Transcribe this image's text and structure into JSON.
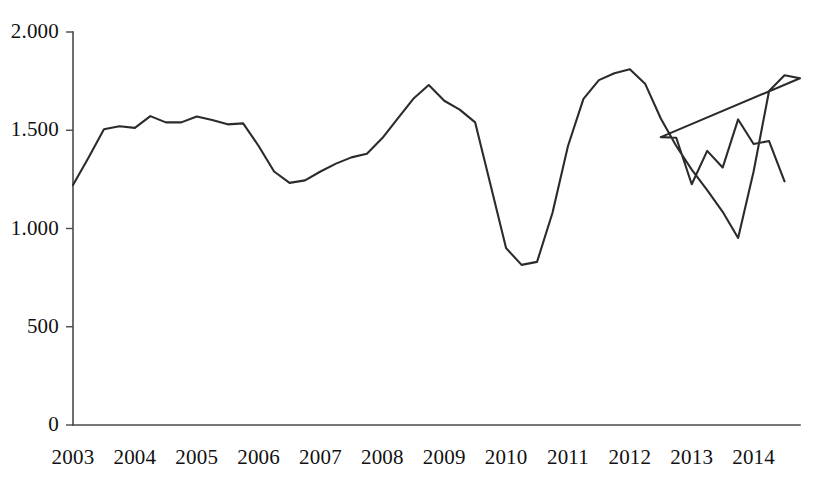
{
  "chart_data": {
    "type": "line",
    "title": "",
    "subtitle": "",
    "xlabel": "",
    "ylabel": "",
    "grid": false,
    "legend": null,
    "legend_position": "none",
    "line_color": "#2b2b2b",
    "axis_color": "#4a4a4a",
    "background": "#ffffff",
    "ylim": [
      0,
      2000
    ],
    "ytick_labels": [
      "2.000",
      "1.500",
      "1.000",
      "500",
      "0"
    ],
    "ytick_values": [
      2000,
      1500,
      1000,
      500,
      0
    ],
    "xtick_labels": [
      "2003",
      "2004",
      "2005",
      "2006",
      "2007",
      "2008",
      "2009",
      "2010",
      "2011",
      "2012",
      "2013",
      "2014"
    ],
    "xtick_values": [
      2003,
      2004,
      2005,
      2006,
      2007,
      2008,
      2009,
      2010,
      2011,
      2012,
      2013,
      2014
    ],
    "xlim": [
      2003,
      2014.75
    ],
    "series": [
      {
        "name": "series-1",
        "x": [
          2003.0,
          2003.25,
          2003.5,
          2003.75,
          2004.0,
          2004.25,
          2004.5,
          2004.75,
          2005.0,
          2005.25,
          2005.5,
          2005.75,
          2006.0,
          2006.25,
          2006.5,
          2006.75,
          2007.0,
          2007.25,
          2007.5,
          2007.75,
          2008.0,
          2008.25,
          2008.5,
          2008.75,
          2009.0,
          2009.25,
          2009.5,
          2009.75,
          2010.0,
          2010.25,
          2010.5,
          2010.75,
          2011.0,
          2011.25,
          2011.5,
          2011.75,
          2012.0,
          2012.25,
          2012.5,
          2012.75,
          2013.0,
          2013.25,
          2013.5,
          2013.75,
          2014.0,
          2014.25,
          2014.5,
          2014.75
        ],
        "values": [
          1221,
          1360,
          1505,
          1520,
          1512,
          1572,
          1540,
          1540,
          1570,
          1552,
          1530,
          1535,
          1420,
          1290,
          1232,
          1245,
          1290,
          1330,
          1362,
          1380,
          1460,
          1560,
          1660,
          1730,
          1650,
          1605,
          1540,
          1220,
          900,
          815,
          830,
          1080,
          1420,
          1660,
          1755,
          1790,
          1810,
          1735,
          1560,
          1420,
          1300,
          1195,
          1085,
          952,
          1290,
          1700,
          1780,
          1765
        ]
      }
    ],
    "tail_x": [
      2012.5,
      2012.75,
      2013.0,
      2013.25,
      2013.5,
      2013.75,
      2014.0,
      2014.25,
      2014.5,
      2014.75
    ],
    "tail_values": [
      1465,
      1462,
      1225,
      1395,
      1310,
      1555,
      1430,
      1445,
      1240
    ]
  }
}
